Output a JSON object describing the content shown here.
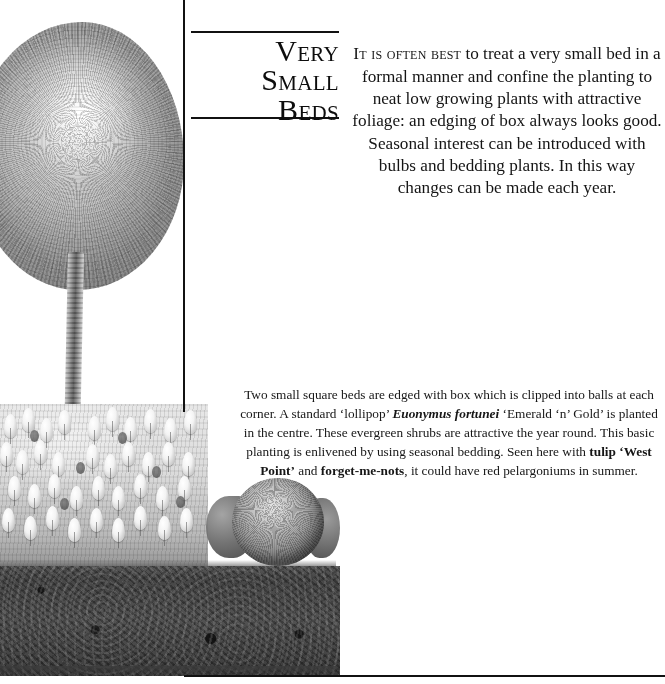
{
  "page": {
    "background_color": "#ffffff",
    "rule_color": "#111111",
    "text_color": "#141414"
  },
  "title": {
    "line1": "Very Small",
    "line2": "Beds",
    "full": "Very Small\nBeds"
  },
  "intro": {
    "lead": "It is often best",
    "rest": " to treat a very small bed in a formal manner and confine the planting to neat low growing plants with attractive foliage: an edging of box always looks good. Seasonal interest can be introduced with bulbs and bedding plants. In this way changes can be made each year."
  },
  "caption": {
    "part1": "Two small square beds are edged with box which is clipped into balls at each corner. A standard ‘lollipop’ ",
    "species": "Euonymus fortunei",
    "part2": " ‘Emerald ‘n’ Gold’ is planted in the centre. These evergreen shrubs are attractive the year round. This basic planting is enlivened by using seasonal bedding. Seen here with ",
    "bold1": "tulip",
    "part3": " ",
    "bold2": "‘West Point’",
    "part4": " and ",
    "bold3": "forget-me-nots",
    "part5": ", it could have red pelargoniums in summer."
  },
  "illustration": {
    "description": "Pencil illustration of a standard lollipop-trained Euonymus fortunei tree above a bed of tulips, with a clipped box ball and a band of dark soil below",
    "elements": [
      "tree-canopy",
      "tree-trunk",
      "tulip-flower-bed",
      "box-ball",
      "soil-band"
    ]
  }
}
